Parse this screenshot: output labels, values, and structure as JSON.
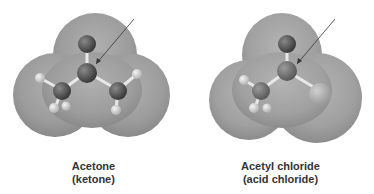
{
  "figures": [
    {
      "name": "Acetone",
      "class": "(ketone)"
    },
    {
      "name": "Acetyl chloride",
      "class": "(acid chloride)"
    }
  ],
  "colors": {
    "surface": "#9a9a9a",
    "carbon": "#555555",
    "oxygen": "#444444",
    "hydrogen": "#d8d8d8",
    "chlorine": "#b8b8b8",
    "arrow": "#333333"
  }
}
